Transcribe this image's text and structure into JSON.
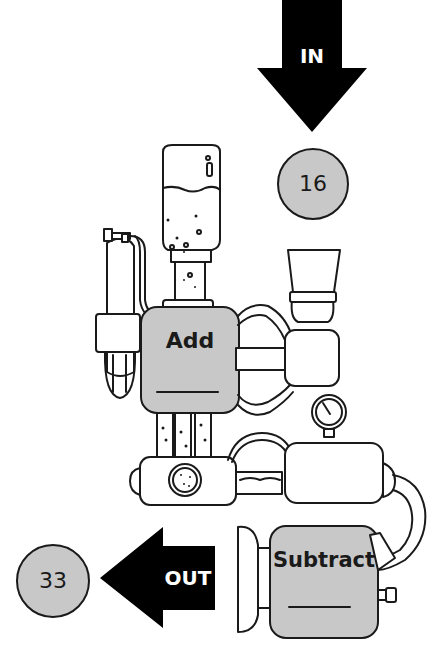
{
  "diagram": {
    "type": "function-machine",
    "input": {
      "arrow_label": "IN",
      "value": "16"
    },
    "operations": [
      {
        "label": "Add",
        "answer_blank": ""
      },
      {
        "label": "Subtract",
        "answer_blank": ""
      }
    ],
    "output": {
      "arrow_label": "OUT",
      "value": "33"
    }
  },
  "colors": {
    "machine_fill": "#c8c8c8",
    "outline": "#1a1a1a",
    "arrow": "#000000",
    "background": "#ffffff"
  }
}
